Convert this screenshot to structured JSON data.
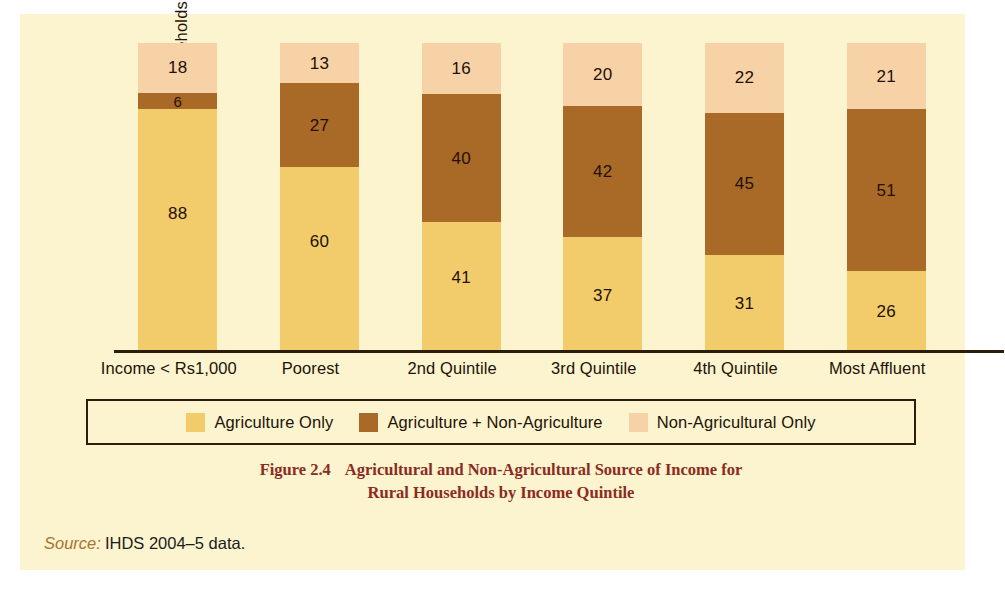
{
  "figure": {
    "caption_number": "Figure 2.4",
    "caption_line1": "Agricultural and Non-Agricultural Source of Income for",
    "caption_line2": "Rural Households by Income Quintile",
    "source_word": "Source:",
    "source_text": "IHDS 2004–5 data.",
    "caption_color": "#8C2B22",
    "background_color": "#FBF4CE"
  },
  "chart_data": {
    "type": "bar",
    "subtype": "stacked-100-percent",
    "title": "Agricultural and Non-Agricultural Source of Income for Rural Households by Income Quintile",
    "xlabel": "",
    "ylabel": "Per cent Households",
    "grid": false,
    "legend_position": "bottom",
    "ylim": [
      0,
      100
    ],
    "axis_ticks_visible": false,
    "categories": [
      "Income < Rs1,000",
      "Poorest",
      "2nd Quintile",
      "3rd Quintile",
      "4th Quintile",
      "Most Affluent"
    ],
    "series": [
      {
        "name": "Agriculture Only",
        "color": "#F2CC6B",
        "values": [
          88,
          60,
          41,
          37,
          31,
          26
        ]
      },
      {
        "name": "Agriculture + Non-Agriculture",
        "color": "#A96A28",
        "values": [
          6,
          27,
          40,
          42,
          45,
          51
        ]
      },
      {
        "name": "Non-Agricultural Only",
        "color": "#F7D2A6",
        "values": [
          18,
          13,
          16,
          20,
          22,
          21
        ]
      }
    ]
  }
}
